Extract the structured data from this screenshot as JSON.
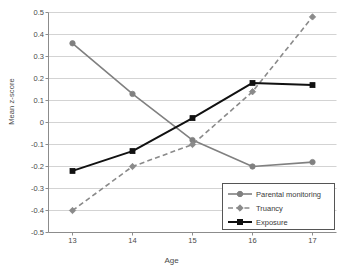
{
  "chart_data": {
    "type": "line",
    "title": "",
    "xlabel": "Age",
    "ylabel": "Mean z-score",
    "x": [
      13,
      14,
      15,
      16,
      17
    ],
    "categories": [
      "13",
      "14",
      "15",
      "16",
      "17"
    ],
    "xlim": [
      12.6,
      17.4
    ],
    "ylim": [
      -0.5,
      0.5
    ],
    "ytick_labels": [
      "0.5",
      "0.4",
      "0.3",
      "0.2",
      "0.1",
      "0",
      "-0.1",
      "-0.2",
      "-0.3",
      "-0.4",
      "-0.5"
    ],
    "ytick_values": [
      0.5,
      0.4,
      0.3,
      0.2,
      0.1,
      0,
      -0.1,
      -0.2,
      -0.3,
      -0.4,
      -0.5
    ],
    "grid": "horizontal",
    "legend_position": "lower-right-inside",
    "series": [
      {
        "name": "Parental monitoring",
        "values": [
          0.36,
          0.13,
          -0.08,
          -0.2,
          -0.18
        ],
        "color": "#808080",
        "marker": "circle",
        "dash": "solid"
      },
      {
        "name": "Truancy",
        "values": [
          -0.4,
          -0.2,
          -0.1,
          0.14,
          0.48
        ],
        "color": "#8a8a8a",
        "marker": "diamond",
        "dash": "dashed"
      },
      {
        "name": "Exposure",
        "values": [
          -0.22,
          -0.13,
          0.02,
          0.18,
          0.17
        ],
        "color": "#111111",
        "marker": "square",
        "dash": "solid"
      }
    ]
  },
  "legend": {
    "items": [
      {
        "label": "Parental monitoring"
      },
      {
        "label": "Truancy"
      },
      {
        "label": "Exposure"
      }
    ]
  },
  "colors": {
    "axis": "#8c8c8c",
    "grid": "#c8c8c8",
    "text": "#4a4a4a",
    "background": "#ffffff"
  }
}
